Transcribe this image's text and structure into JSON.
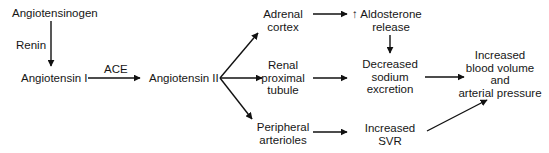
{
  "diagram": {
    "nodes": {
      "angiotensinogen": "Angiotensinogen",
      "renin": "Renin",
      "angiotensin_1": "Angiotensin I",
      "ace": "ACE",
      "angiotensin_2": "Angiotensin II",
      "adrenal_cortex": [
        "Adrenal",
        "cortex"
      ],
      "renal_proximal_tubule": [
        "Renal",
        "proximal",
        "tubule"
      ],
      "peripheral_arterioles": [
        "Peripheral",
        "arterioles"
      ],
      "aldosterone_release": {
        "arrow_glyph": "↑",
        "lines": [
          "Aldosterone",
          "release"
        ]
      },
      "decreased_sodium_excretion": [
        "Decreased",
        "sodium",
        "excretion"
      ],
      "increased_svr": [
        "Increased",
        "SVR"
      ],
      "outcome": [
        "Increased",
        "blood volume",
        "and",
        "arterial pressure"
      ]
    },
    "edges": [
      {
        "from": "Angiotensinogen",
        "to": "Angiotensin I",
        "label": "Renin"
      },
      {
        "from": "Angiotensin I",
        "to": "Angiotensin II",
        "label": "ACE"
      },
      {
        "from": "Angiotensin II",
        "to": "Adrenal cortex"
      },
      {
        "from": "Angiotensin II",
        "to": "Renal proximal tubule"
      },
      {
        "from": "Angiotensin II",
        "to": "Peripheral arterioles"
      },
      {
        "from": "Adrenal cortex",
        "to": "Aldosterone release"
      },
      {
        "from": "Aldosterone release",
        "to": "Decreased sodium excretion"
      },
      {
        "from": "Renal proximal tubule",
        "to": "Decreased sodium excretion"
      },
      {
        "from": "Peripheral arterioles",
        "to": "Increased SVR"
      },
      {
        "from": "Decreased sodium excretion",
        "to": "Increased blood volume and arterial pressure"
      },
      {
        "from": "Increased SVR",
        "to": "Increased blood volume and arterial pressure"
      }
    ],
    "colors": {
      "stroke": "#111111",
      "text": "#161616",
      "background": "#ffffff"
    }
  }
}
